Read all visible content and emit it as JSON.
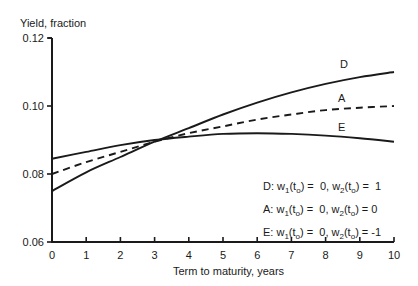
{
  "chart_data": {
    "type": "line",
    "title": "",
    "xlabel": "Term to maturity, years",
    "ylabel": "Yield, fraction",
    "xlim": [
      0,
      10
    ],
    "ylim": [
      0.06,
      0.12
    ],
    "x_ticks": [
      "0",
      "1",
      "2",
      "3",
      "4",
      "5",
      "6",
      "7",
      "8",
      "9",
      "10"
    ],
    "y_ticks": [
      "0.06",
      "0.08",
      "0.10",
      "0.12"
    ],
    "grid": false,
    "x": [
      0,
      1,
      2,
      3,
      4,
      5,
      6,
      7,
      8,
      9,
      10
    ],
    "series": [
      {
        "name": "D",
        "style": "solid",
        "values": [
          0.075,
          0.0805,
          0.085,
          0.0895,
          0.0935,
          0.0975,
          0.101,
          0.104,
          0.1065,
          0.1085,
          0.11
        ]
      },
      {
        "name": "A",
        "style": "dashed",
        "values": [
          0.08,
          0.0835,
          0.0865,
          0.0895,
          0.092,
          0.094,
          0.096,
          0.0975,
          0.0988,
          0.0995,
          0.1
        ]
      },
      {
        "name": "E",
        "style": "solid",
        "values": [
          0.0845,
          0.0865,
          0.0885,
          0.09,
          0.091,
          0.0918,
          0.092,
          0.0918,
          0.0913,
          0.0905,
          0.0895
        ]
      }
    ],
    "annotations": [
      "D",
      "A",
      "E"
    ],
    "legend_position": "lower right"
  },
  "legend": [
    {
      "curve": "D:",
      "w1": "0,",
      "w2": "1"
    },
    {
      "curve": "A:",
      "w1": "0,",
      "w2": "0"
    },
    {
      "curve": "E:",
      "w1": "0,",
      "w2": "-1"
    }
  ]
}
